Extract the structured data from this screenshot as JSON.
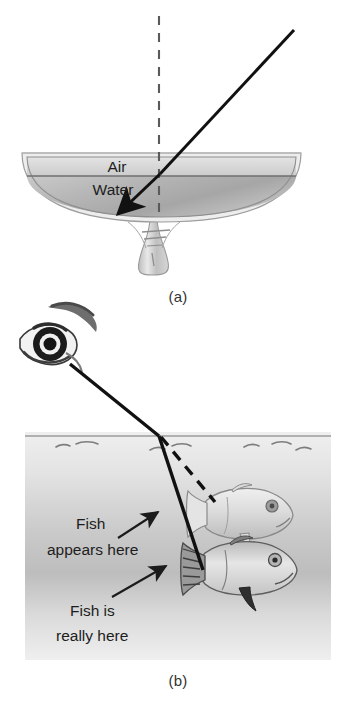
{
  "figure": {
    "title_implicit": "Refraction of light at an air-water boundary",
    "panels": [
      {
        "id": "a",
        "caption": "(a)",
        "labels": {
          "air": "Air",
          "water": "Water"
        },
        "elements": {
          "normal_line": "dashed vertical normal",
          "incident_ray": "incident ray in air",
          "refracted_ray": "refracted ray in water",
          "vessel": "glass bowl on stem"
        }
      },
      {
        "id": "b",
        "caption": "(b)",
        "labels": {
          "apparent": "Fish\nappears here",
          "apparent_line1": "Fish",
          "apparent_line2": "appears here",
          "real_line1": "Fish is",
          "real_line2": "really here"
        },
        "elements": {
          "eye": "observer eye with eyebrow",
          "sight_line": "straight line of sight from eye",
          "apparent_ray": "dashed ray to apparent fish",
          "fish_apparent": "apparent (virtual) fish image",
          "fish_real": "real fish",
          "water_surface": "water surface with ripples",
          "water_body": "shaded water region"
        }
      }
    ],
    "colors": {
      "ray": "#111111",
      "normal_dash": "#5a5a5a",
      "water_light": "#d9d9d9",
      "water_dark": "#a8a8a8",
      "air_fill": "#dcdcdc",
      "text": "#1d1d1d",
      "background": "#ffffff"
    }
  }
}
